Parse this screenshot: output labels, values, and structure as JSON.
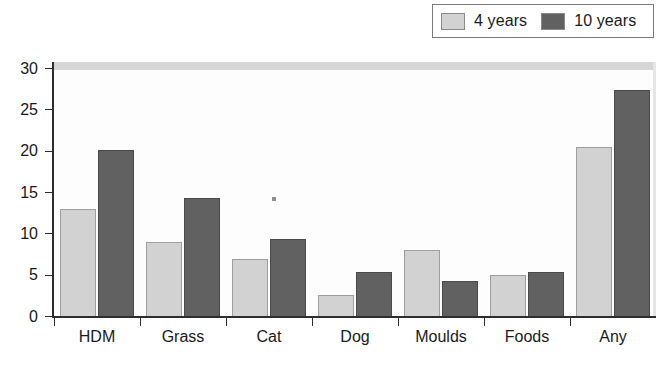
{
  "chart_data": {
    "type": "bar",
    "title": "",
    "xlabel": "",
    "ylabel": "",
    "ylim": [
      0,
      30
    ],
    "ytick_step": 5,
    "yticks": [
      0,
      5,
      10,
      15,
      20,
      25,
      30
    ],
    "grid": false,
    "legend_position": "top-right",
    "categories": [
      "HDM",
      "Grass",
      "Cat",
      "Dog",
      "Moulds",
      "Foods",
      "Any"
    ],
    "series": [
      {
        "name": "4 years",
        "color": "#d2d2d2",
        "values": [
          13.0,
          9.0,
          6.9,
          2.6,
          8.0,
          5.0,
          20.4
        ]
      },
      {
        "name": "10 years",
        "color": "#616161",
        "values": [
          20.1,
          14.3,
          9.3,
          5.3,
          4.2,
          5.3,
          27.3
        ]
      }
    ]
  },
  "legend": {
    "entries": [
      {
        "label": "4 years",
        "swatch": "light-gray-swatch"
      },
      {
        "label": "10 years",
        "swatch": "dark-gray-swatch"
      }
    ]
  },
  "axes": {
    "y_tick_labels": [
      "30",
      "25",
      "20",
      "15",
      "10",
      "5",
      "0"
    ],
    "x_tick_labels": [
      "HDM",
      "Grass",
      "Cat",
      "Dog",
      "Moulds",
      "Foods",
      "Any"
    ]
  }
}
